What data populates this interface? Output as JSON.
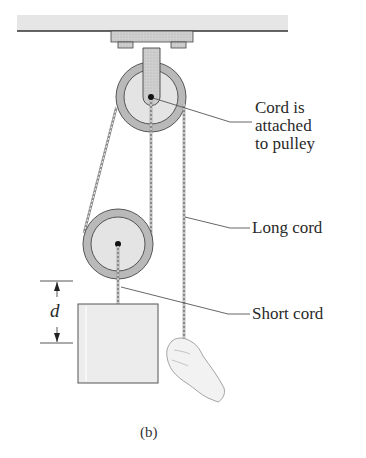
{
  "figure": {
    "caption": "(b)",
    "caption_letter": "b",
    "labels": {
      "attached": [
        "Cord is",
        "attached",
        "to pulley"
      ],
      "long_cord": "Long cord",
      "short_cord": "Short cord"
    },
    "dimension": {
      "symbol": "d"
    },
    "colors": {
      "ceiling": "#e6e6e6",
      "metal": "#c8c8c8",
      "pulley_rim": "#b9b9b9",
      "pulley_face": "#e4e4e4",
      "box": "#ececec",
      "cord": "#8a8a8a",
      "leader": "#555555"
    }
  }
}
